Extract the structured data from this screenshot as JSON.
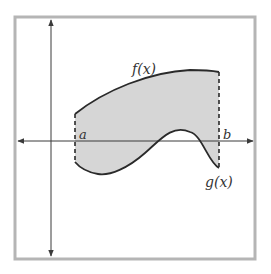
{
  "figure": {
    "labels": {
      "f": "f(x)",
      "g": "g(x)",
      "a": "a",
      "b": "b"
    },
    "colors": {
      "frame": "#b5b5b5",
      "fill": "#d6d6d6",
      "curve": "#2a2a2a",
      "axis": "#3a3a3a",
      "background": "#ffffff"
    }
  }
}
